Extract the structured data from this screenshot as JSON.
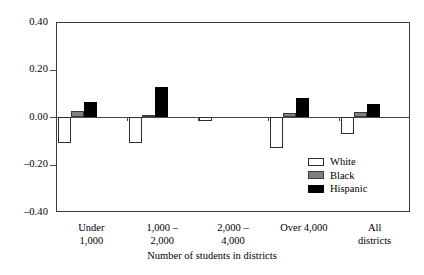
{
  "chart_data": {
    "type": "bar",
    "title": "",
    "subtitle": "",
    "xlabel": "Number of students in districts",
    "ylabel": "",
    "ylim": [
      -0.4,
      0.4
    ],
    "ytick_values": [
      0.4,
      0.2,
      0.0,
      -0.2,
      -0.4
    ],
    "ytick_labels": [
      "0.40",
      "0.20",
      "0.00",
      "–0.20",
      "–0.40"
    ],
    "grid": false,
    "legend_position": "inside-lower-right",
    "categories": [
      "Under\n1,000",
      "1,000 –\n2,000",
      "2,000 –\n4,000",
      "Over 4,000",
      "All\ndistricts"
    ],
    "series": [
      {
        "name": "White",
        "color": "#ffffff",
        "edge": "#2e2e2e",
        "values": [
          -0.11,
          -0.11,
          -0.015,
          -0.13,
          -0.07
        ]
      },
      {
        "name": "Black",
        "color": "#808080",
        "edge": "#3a3a3a",
        "values": [
          0.025,
          0.01,
          0.0,
          0.015,
          0.02
        ]
      },
      {
        "name": "Hispanic",
        "color": "#000000",
        "edge": "#000000",
        "values": [
          0.063,
          0.125,
          0.0,
          0.082,
          0.055
        ]
      }
    ]
  },
  "legend": {
    "items": [
      {
        "label": "White"
      },
      {
        "label": "Black"
      },
      {
        "label": "Hispanic"
      }
    ]
  }
}
